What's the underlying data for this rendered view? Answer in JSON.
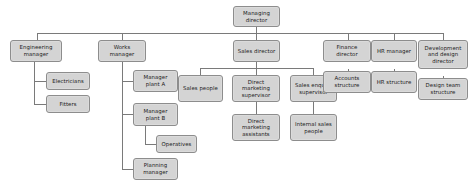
{
  "chart_title": "Organisation structure chart",
  "colors": {
    "node_fill": "#d4d4d4",
    "node_border": "#8d8d8d",
    "connector": "#7a7a7a",
    "background": "#ffffff",
    "text": "#1c1c1c"
  },
  "nodes": {
    "managing_director": "Managing director",
    "engineering_manager": "Engineering manager",
    "electricians": "Electricians",
    "fitters": "Fitters",
    "works_manager": "Works manager",
    "manager_plant_a": "Manager plant A",
    "manager_plant_b": "Manager plant B",
    "operatives": "Operatives",
    "planning_manager": "Planning manager",
    "sales_director": "Sales director",
    "sales_people": "Sales people",
    "direct_marketing_supervisor": "Direct marketing supervisor",
    "direct_marketing_assistants": "Direct marketing assistants",
    "sales_enquiry_supervisor": "Sales enquiry supervisor",
    "internal_sales_people": "Internal sales people",
    "finance_director": "Finance director",
    "accounts_structure": "Accounts structure",
    "hr_manager": "HR manager",
    "hr_structure": "HR structure",
    "development_and_design_director": "Development and design director",
    "design_team_structure": "Design team structure"
  },
  "hierarchy": {
    "root": "Managing director",
    "children": [
      {
        "label": "Engineering manager",
        "children": [
          {
            "label": "Electricians"
          },
          {
            "label": "Fitters"
          }
        ]
      },
      {
        "label": "Works manager",
        "children": [
          {
            "label": "Manager plant A"
          },
          {
            "label": "Manager plant B",
            "children": [
              {
                "label": "Operatives"
              }
            ]
          },
          {
            "label": "Planning manager"
          }
        ]
      },
      {
        "label": "Sales director",
        "children": [
          {
            "label": "Sales people"
          },
          {
            "label": "Direct marketing supervisor",
            "children": [
              {
                "label": "Direct marketing assistants"
              }
            ]
          },
          {
            "label": "Sales enquiry supervisor",
            "children": [
              {
                "label": "Internal sales people"
              }
            ]
          }
        ]
      },
      {
        "label": "Finance director",
        "children": [
          {
            "label": "Accounts structure"
          }
        ]
      },
      {
        "label": "HR manager",
        "children": [
          {
            "label": "HR structure"
          }
        ]
      },
      {
        "label": "Development and design director",
        "children": [
          {
            "label": "Design team structure"
          }
        ]
      }
    ]
  }
}
